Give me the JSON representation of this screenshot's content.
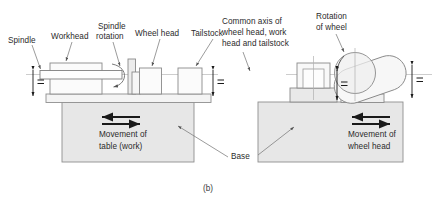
{
  "figure": {
    "caption": "(b)",
    "colors": {
      "outline": "#8c8c8c",
      "dark_outline": "#5a5a5a",
      "fill_light": "#f2f2f2",
      "fill_base": "#e4e4e4",
      "fill_mid": "#ebebeb",
      "arrow": "#1a1a1a",
      "text": "#2b2b2b",
      "leader": "#7a7a7a",
      "axis": "#b5b5b5"
    }
  },
  "labels": {
    "spindle": "Spindle",
    "workhead": "Workhead",
    "spindle_rotation_line1": "Spindle",
    "spindle_rotation_line2": "rotation",
    "wheel_head": "Wheel head",
    "tailstock": "Tailstock",
    "common_axis_line1": "Common axis of",
    "common_axis_line2": "wheel head, work",
    "common_axis_line3": "head and tailstock",
    "rotation_of_wheel_line1": "Rotation",
    "rotation_of_wheel_line2": "of wheel",
    "movement_table_line1": "Movement of",
    "movement_table_line2": "table (work)",
    "movement_wheelhead_line1": "Movement of",
    "movement_wheelhead_line2": "wheel head",
    "base": "Base"
  },
  "dimensions": {
    "equal_mark": "=",
    "marks_count": 4
  },
  "views": {
    "left": {
      "name": "front-elevation",
      "parts": [
        "spindle",
        "workhead",
        "table",
        "wheel-head",
        "tailstock",
        "base"
      ]
    },
    "right": {
      "name": "end-elevation",
      "parts": [
        "workhead-block",
        "grinding-wheel",
        "wheel-head-body",
        "base"
      ]
    }
  }
}
